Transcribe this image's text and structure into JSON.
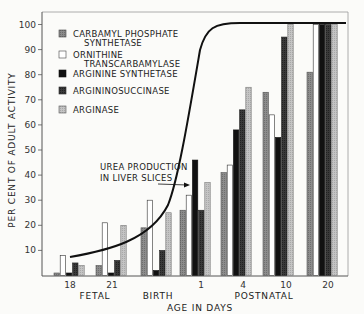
{
  "chart_data": {
    "type": "bar",
    "title": "",
    "xlabel": "AGE IN DAYS",
    "ylabel": "PER CENT OF ADULT ACTIVITY",
    "ylim": [
      0,
      100
    ],
    "yticks": [
      10,
      20,
      30,
      40,
      50,
      60,
      70,
      80,
      90,
      100
    ],
    "categories": [
      "18",
      "21",
      "Birth",
      "1",
      "4",
      "10",
      "20"
    ],
    "x_tick_labels": [
      "18",
      "21",
      "1",
      "4",
      "10",
      "20"
    ],
    "x_group_labels": [
      "FETAL",
      "BIRTH",
      "POSTNATAL"
    ],
    "series": [
      {
        "name": "CARBAMYL PHOSPHATE SYNTHETASE",
        "color": "#8a8a8a",
        "values": [
          1,
          4,
          19,
          26,
          41,
          73,
          81
        ]
      },
      {
        "name": "ORNITHINE TRANSCARBAMYLASE",
        "color": "#ffffff",
        "values": [
          8,
          21,
          30,
          32,
          44,
          64,
          100
        ]
      },
      {
        "name": "ARGININE SYNTHETASE",
        "color": "#111111",
        "values": [
          1,
          1,
          2,
          46,
          58,
          55,
          100
        ]
      },
      {
        "name": "ARGININOSUCCINASE",
        "color": "#333333",
        "values": [
          5,
          6,
          10,
          26,
          66,
          95,
          100
        ]
      },
      {
        "name": "ARGINASE",
        "color": "#b8b8b8",
        "values": [
          4,
          20,
          25,
          37,
          75,
          100,
          100
        ]
      }
    ],
    "curve": {
      "name": "UREA PRODUCTION IN LIVER SLICES",
      "points": [
        [
          18,
          6
        ],
        [
          21,
          10
        ],
        [
          0,
          15
        ],
        [
          0.5,
          30
        ],
        [
          1,
          50
        ],
        [
          2,
          90
        ],
        [
          3,
          100
        ],
        [
          20,
          100
        ]
      ]
    },
    "annotations": [
      "UREA PRODUCTION",
      "IN LIVER SLICES"
    ],
    "legend_position": "upper left",
    "grid": false
  },
  "legend": {
    "items": [
      {
        "line1": "CARBAMYL  PHOSPHATE",
        "line2": "SYNTHETASE"
      },
      {
        "line1": "ORNITHINE",
        "line2": "TRANSCARBAMYLASE"
      },
      {
        "line1": "ARGININE  SYNTHETASE",
        "line2": ""
      },
      {
        "line1": "ARGININOSUCCINASE",
        "line2": ""
      },
      {
        "line1": "ARGINASE",
        "line2": ""
      }
    ]
  },
  "axis": {
    "ylabel": "PER CENT OF ADULT ACTIVITY",
    "xlabel": "AGE IN DAYS",
    "fetal": "FETAL",
    "birth": "BIRTH",
    "postnatal": "POSTNATAL",
    "annotation_line1": "UREA PRODUCTION",
    "annotation_line2": "IN LIVER SLICES"
  }
}
